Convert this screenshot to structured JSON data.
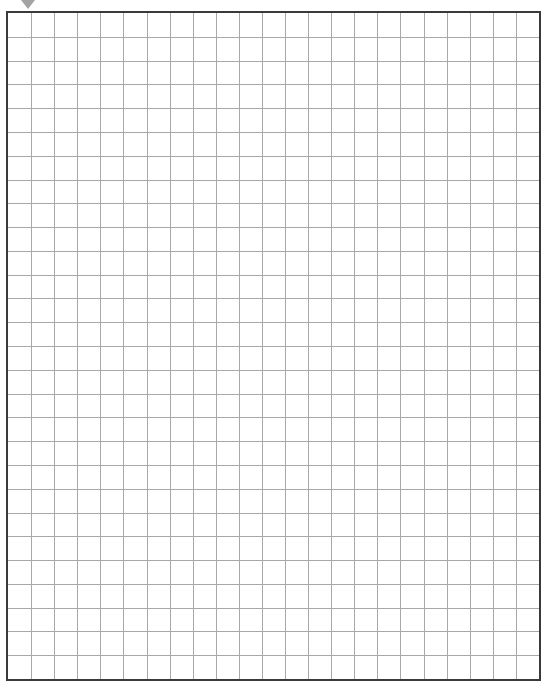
{
  "sheet": {
    "type": "graph paper",
    "background_color": "#ffffff",
    "frame": {
      "left": 6,
      "top": 11,
      "right": 541,
      "bottom": 681,
      "border_color": "#3a3a3a",
      "border_width": 2
    },
    "grid": {
      "columns": 23,
      "rows": 28,
      "line_color": "#a8a8a8",
      "line_width": 1
    },
    "corner_mark": {
      "shape": "triangle",
      "color": "#a3a3a3"
    }
  }
}
